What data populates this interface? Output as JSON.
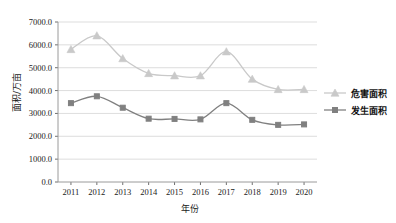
{
  "chart_data": {
    "type": "line",
    "title": "",
    "xlabel": "年份",
    "ylabel": "面积/万亩",
    "categories": [
      "2011",
      "2012",
      "2013",
      "2014",
      "2015",
      "2016",
      "2017",
      "2018",
      "2019",
      "2020"
    ],
    "x": [
      2011,
      2012,
      2013,
      2014,
      2015,
      2016,
      2017,
      2018,
      2019,
      2020
    ],
    "series": [
      {
        "name": "危害面积",
        "marker": "triangle",
        "color": "#c9c9c9",
        "values": [
          5800,
          6400,
          5400,
          4750,
          4650,
          4650,
          5700,
          4500,
          4050,
          4050
        ]
      },
      {
        "name": "发生面积",
        "marker": "square",
        "color": "#808080",
        "values": [
          3450,
          3750,
          3250,
          2770,
          2760,
          2740,
          3450,
          2720,
          2500,
          2520
        ]
      }
    ],
    "ylim": [
      0,
      7000
    ],
    "ytick_values": [
      0,
      1000,
      2000,
      3000,
      4000,
      5000,
      6000,
      7000
    ],
    "ytick_labels": [
      "0.0",
      "1000.0",
      "2000.0",
      "3000.0",
      "4000.0",
      "5000.0",
      "6000.0",
      "7000.0"
    ],
    "grid": true,
    "grid_color": "#d4d4d4",
    "legend_position": "right",
    "legend": [
      "危害面积",
      "发生面积"
    ]
  }
}
